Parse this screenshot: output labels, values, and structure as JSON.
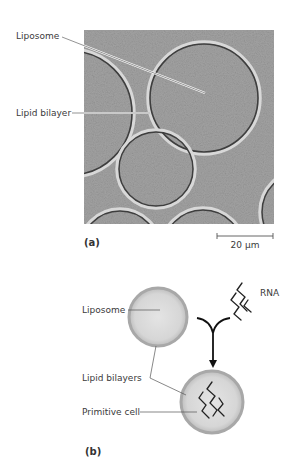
{
  "panel_a": {
    "id_label": "(a)",
    "labels": {
      "liposome": "Liposome",
      "lipid_bilayer": "Lipid bilayer"
    },
    "scale_bar": "20 μm",
    "image_description": "Electron micrograph of liposomes (lipid bilayer vesicles)"
  },
  "panel_b": {
    "id_label": "(b)",
    "labels": {
      "liposome": "Liposome",
      "rna": "RNA",
      "lipid_bilayers": "Lipid bilayers",
      "primitive_cell": "Primitive cell"
    }
  },
  "colors": {
    "micrograph_bg": "#9a9a9a",
    "membrane": "#3a3a3a",
    "vesicle_fill": "#dcdcdc",
    "vesicle_rim": "#a8a8a8",
    "rna": "#222222",
    "text": "#3a3a3a"
  }
}
